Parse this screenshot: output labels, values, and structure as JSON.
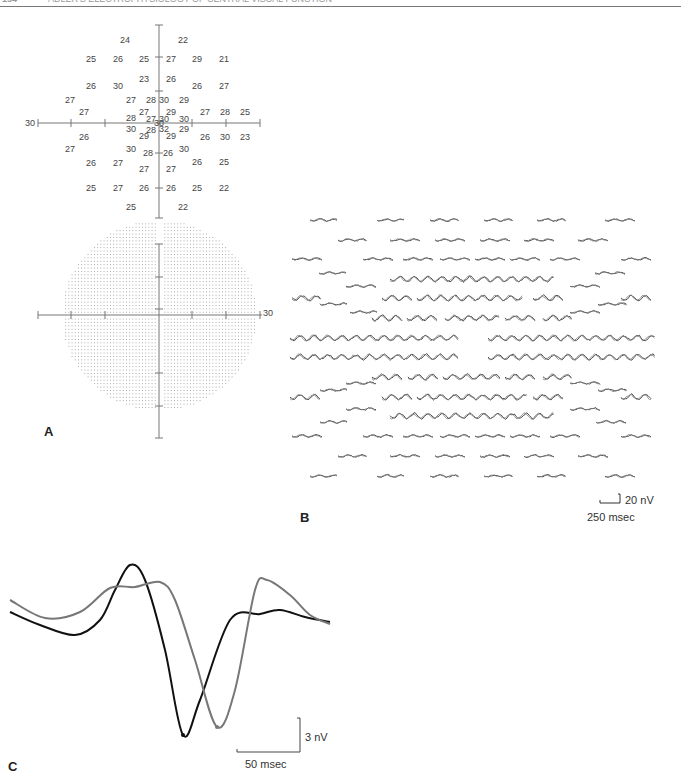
{
  "header": {
    "page_number": "154",
    "running_title": "ADLER'S ELECTROPHYSIOLOGY OF CENTRAL VISUAL FUNCTION"
  },
  "panels": {
    "a": {
      "label": "A",
      "axis_extent_label": "30",
      "dot_plot_axis_label": "30"
    },
    "b": {
      "label": "B",
      "scale_v": "20 nV",
      "scale_h": "250 msec"
    },
    "c": {
      "label": "C",
      "scale_v": "3 nV",
      "scale_h": "50 msec"
    }
  },
  "chart_data": [
    {
      "type": "scatter",
      "title": "Visual field threshold values (dB)",
      "xlabel": "",
      "ylabel": "",
      "axis_range_deg": 30,
      "points": [
        {
          "x": 125,
          "y": 40,
          "v": "24"
        },
        {
          "x": 183,
          "y": 40,
          "v": "22"
        },
        {
          "x": 91,
          "y": 59,
          "v": "25"
        },
        {
          "x": 118,
          "y": 59,
          "v": "26"
        },
        {
          "x": 144,
          "y": 59,
          "v": "25"
        },
        {
          "x": 171,
          "y": 59,
          "v": "27"
        },
        {
          "x": 197,
          "y": 59,
          "v": "29"
        },
        {
          "x": 224,
          "y": 59,
          "v": "21"
        },
        {
          "x": 144,
          "y": 79,
          "v": "23"
        },
        {
          "x": 171,
          "y": 79,
          "v": "26"
        },
        {
          "x": 91,
          "y": 86,
          "v": "26"
        },
        {
          "x": 118,
          "y": 86,
          "v": "30"
        },
        {
          "x": 197,
          "y": 86,
          "v": "26"
        },
        {
          "x": 224,
          "y": 86,
          "v": "27"
        },
        {
          "x": 70,
          "y": 100,
          "v": "27"
        },
        {
          "x": 131,
          "y": 100,
          "v": "27"
        },
        {
          "x": 151,
          "y": 100,
          "v": "28"
        },
        {
          "x": 164,
          "y": 100,
          "v": "30"
        },
        {
          "x": 184,
          "y": 100,
          "v": "29"
        },
        {
          "x": 84,
          "y": 112,
          "v": "27"
        },
        {
          "x": 144,
          "y": 112,
          "v": "27"
        },
        {
          "x": 171,
          "y": 112,
          "v": "29"
        },
        {
          "x": 205,
          "y": 112,
          "v": "27"
        },
        {
          "x": 225,
          "y": 112,
          "v": "28"
        },
        {
          "x": 245,
          "y": 112,
          "v": "25"
        },
        {
          "x": 131,
          "y": 118,
          "v": "28"
        },
        {
          "x": 151,
          "y": 119,
          "v": "27"
        },
        {
          "x": 164,
          "y": 119,
          "v": "30"
        },
        {
          "x": 184,
          "y": 119,
          "v": "30"
        },
        {
          "x": 159,
          "y": 123,
          "v": "30"
        },
        {
          "x": 131,
          "y": 129,
          "v": "30"
        },
        {
          "x": 151,
          "y": 130,
          "v": "28"
        },
        {
          "x": 164,
          "y": 129,
          "v": "32"
        },
        {
          "x": 184,
          "y": 129,
          "v": "29"
        },
        {
          "x": 84,
          "y": 137,
          "v": "26"
        },
        {
          "x": 144,
          "y": 136,
          "v": "29"
        },
        {
          "x": 171,
          "y": 136,
          "v": "29"
        },
        {
          "x": 205,
          "y": 137,
          "v": "26"
        },
        {
          "x": 225,
          "y": 137,
          "v": "30"
        },
        {
          "x": 245,
          "y": 137,
          "v": "23"
        },
        {
          "x": 70,
          "y": 149,
          "v": "27"
        },
        {
          "x": 131,
          "y": 149,
          "v": "30"
        },
        {
          "x": 148,
          "y": 153,
          "v": "28"
        },
        {
          "x": 168,
          "y": 153,
          "v": "26"
        },
        {
          "x": 184,
          "y": 149,
          "v": "30"
        },
        {
          "x": 91,
          "y": 163,
          "v": "26"
        },
        {
          "x": 118,
          "y": 163,
          "v": "27"
        },
        {
          "x": 197,
          "y": 162,
          "v": "26"
        },
        {
          "x": 224,
          "y": 162,
          "v": "25"
        },
        {
          "x": 144,
          "y": 169,
          "v": "27"
        },
        {
          "x": 171,
          "y": 169,
          "v": "27"
        },
        {
          "x": 91,
          "y": 188,
          "v": "25"
        },
        {
          "x": 118,
          "y": 188,
          "v": "27"
        },
        {
          "x": 144,
          "y": 188,
          "v": "26"
        },
        {
          "x": 171,
          "y": 188,
          "v": "26"
        },
        {
          "x": 197,
          "y": 188,
          "v": "25"
        },
        {
          "x": 224,
          "y": 188,
          "v": "22"
        },
        {
          "x": 131,
          "y": 207,
          "v": "25"
        },
        {
          "x": 183,
          "y": 207,
          "v": "22"
        }
      ]
    },
    {
      "type": "scatter",
      "title": "Stimulus hexagon / sample locations dot map",
      "axis_range_deg": 30,
      "grid": true
    },
    {
      "type": "line",
      "title": "Multifocal response trace array",
      "scale": {
        "voltage": "20 nV",
        "time": "250 msec"
      },
      "rows": 16
    },
    {
      "type": "line",
      "title": "Averaged response waveforms",
      "scale": {
        "voltage": "3 nV",
        "time": "50 msec"
      },
      "series": [
        {
          "name": "black trace",
          "color": "#111111",
          "points": [
            [
              10,
              612
            ],
            [
              40,
              625
            ],
            [
              75,
              635
            ],
            [
              100,
              620
            ],
            [
              115,
              590
            ],
            [
              130,
              565
            ],
            [
              145,
              580
            ],
            [
              165,
              650
            ],
            [
              183,
              735
            ],
            [
              200,
              700
            ],
            [
              230,
              620
            ],
            [
              260,
              614
            ],
            [
              280,
              610
            ],
            [
              305,
              617
            ],
            [
              330,
              622
            ]
          ]
        },
        {
          "name": "gray trace",
          "color": "#777777",
          "points": [
            [
              10,
              600
            ],
            [
              45,
              618
            ],
            [
              80,
              612
            ],
            [
              110,
              588
            ],
            [
              135,
              587
            ],
            [
              160,
              582
            ],
            [
              175,
              600
            ],
            [
              195,
              660
            ],
            [
              217,
              727
            ],
            [
              235,
              690
            ],
            [
              255,
              590
            ],
            [
              267,
              580
            ],
            [
              290,
              595
            ],
            [
              310,
              615
            ],
            [
              330,
              624
            ]
          ]
        }
      ]
    }
  ]
}
